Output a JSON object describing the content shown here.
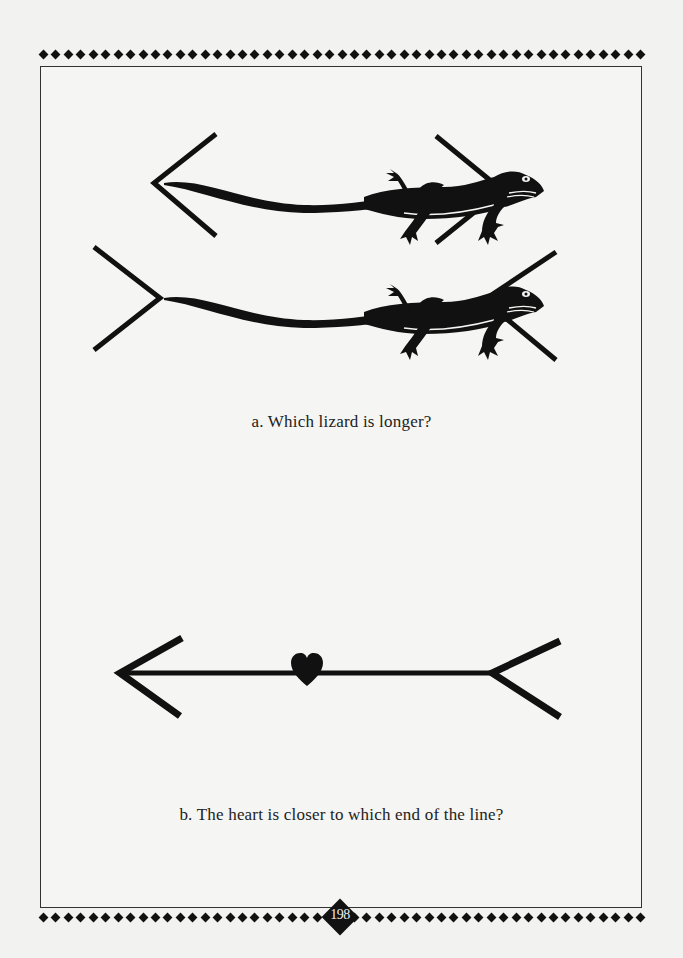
{
  "page": {
    "number": "198",
    "colors": {
      "ink": "#111111",
      "paper": "#f2f2f0",
      "frame_border": "#333333"
    }
  },
  "figure_a": {
    "caption": "a. Which lizard is longer?",
    "illustration": "two identical lizards, top framed by outward-pointing arrowheads (< >), bottom framed by inward-pointing fins (> <) — Müller-Lyer illusion",
    "icons": [
      "lizard-icon",
      "lizard-icon",
      "arrowhead-left-icon",
      "arrowhead-right-icon",
      "fin-left-icon",
      "fin-right-icon"
    ]
  },
  "figure_b": {
    "caption": "b. The heart is closer to which end of the line?",
    "illustration": "horizontal line with an arrowhead on the left end, a fork/tail on the right end, and a heart near the middle",
    "icons": [
      "arrowhead-left-icon",
      "heart-icon",
      "fork-tail-icon"
    ]
  }
}
